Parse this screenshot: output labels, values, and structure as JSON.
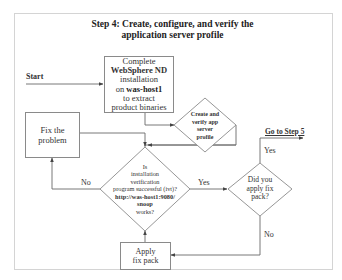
{
  "title": {
    "line1": "Step 4: Create, configure, and verify the",
    "line2": "application server profile"
  },
  "start_label": "Start",
  "goto_label": "Go to Step 5",
  "complete_box": {
    "line1": "Complete",
    "line2": "WebSphere ND",
    "line3": "installation",
    "line4_prefix": "on ",
    "line4_bold": "was-host1",
    "line5": "to extract",
    "line6": "product binaries"
  },
  "create_diamond": {
    "line1": "Create and",
    "line2": "verify app",
    "line3": "server",
    "line4": "profile"
  },
  "fix_box": {
    "line1": "Fix the",
    "line2": "problem"
  },
  "verify_diamond": {
    "line1": "Is",
    "line2": "installation",
    "line3": "verification",
    "line4": "program successful (ivt)?",
    "line5": "http://was-host1:9080/",
    "line6": "snoop",
    "line7": "works?"
  },
  "fixpack_diamond": {
    "line1": "Did you",
    "line2": "apply fix",
    "line3": "pack?"
  },
  "apply_box": {
    "line1": "Apply",
    "line2": "fix pack"
  },
  "edge_labels": {
    "no_left": "No",
    "yes_right": "Yes",
    "yes_up": "Yes",
    "no_down": "No"
  },
  "colors": {
    "line": "#6a6a6a",
    "shape_border": "#8a8a8a",
    "frame": "#d4d4d4"
  }
}
